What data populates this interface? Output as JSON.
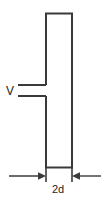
{
  "figure": {
    "type": "technical-schematic",
    "background_color": "#ffffff",
    "line_color": "#3a3a3a",
    "text_color": "#1c1c1c",
    "labels": {
      "voltage": "V",
      "width_dimension": "2d"
    },
    "geometry": {
      "plate_rect": {
        "x": 45,
        "y": 13,
        "width": 28,
        "height": 155
      },
      "lead_upper_y": 85,
      "lead_lower_y": 96,
      "lead_left_x": 18,
      "lead_right_x": 46,
      "dimension_line_y": 176,
      "dimension_left_start_x": 9,
      "dimension_right_start_x": 101,
      "extension_tick_bottom_y": 182
    }
  }
}
